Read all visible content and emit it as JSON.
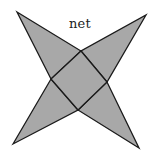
{
  "diagram": {
    "title": "net",
    "colors": {
      "fill": "#a8a8a8",
      "stroke": "#1a1a1a",
      "background": "#ffffff"
    },
    "base_square": {
      "top": [
        81,
        51
      ],
      "right": [
        107,
        82
      ],
      "bottom": [
        78,
        110
      ],
      "left": [
        51,
        79
      ]
    },
    "triangle_tips": {
      "top_left": [
        17,
        12
      ],
      "top_right": [
        146,
        15
      ],
      "bottom_left": [
        13,
        144
      ],
      "bottom_right": [
        139,
        148
      ]
    }
  }
}
